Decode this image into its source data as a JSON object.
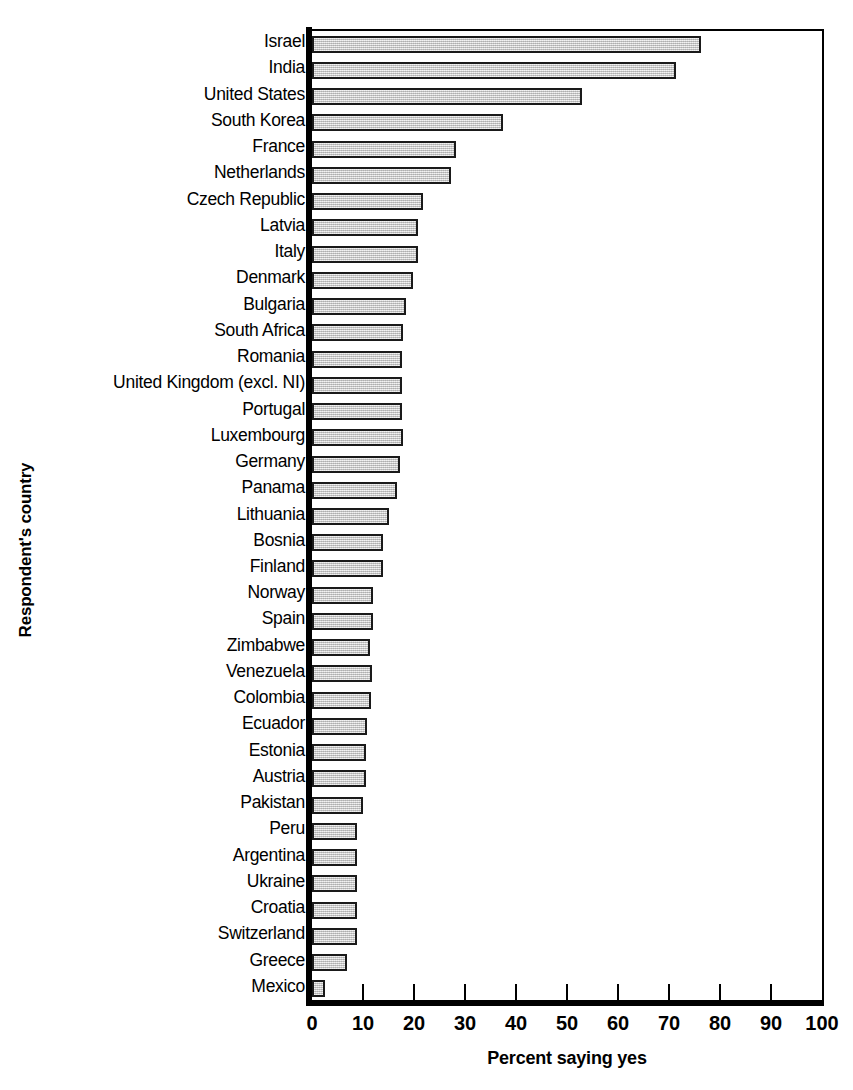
{
  "chart_data": {
    "type": "bar",
    "orientation": "horizontal",
    "title": "",
    "xlabel": "Percent saying yes",
    "ylabel": "Respondent's country",
    "xlim": [
      0,
      100
    ],
    "xticks": [
      0,
      10,
      20,
      30,
      40,
      50,
      60,
      70,
      80,
      90,
      100
    ],
    "grid": false,
    "legend": null,
    "bar_fill_color": "#d4d4d4",
    "bar_edge_color": "#1a1a1a",
    "categories": [
      "Israel",
      "India",
      "United States",
      "South Korea",
      "France",
      "Netherlands",
      "Czech Republic",
      "Latvia",
      "Italy",
      "Denmark",
      "Bulgaria",
      "South Africa",
      "Romania",
      "United Kingdom (excl. NI)",
      "Portugal",
      "Luxembourg",
      "Germany",
      "Panama",
      "Lithuania",
      "Bosnia",
      "Finland",
      "Norway",
      "Spain",
      "Zimbabwe",
      "Venezuela",
      "Colombia",
      "Ecuador",
      "Estonia",
      "Austria",
      "Pakistan",
      "Peru",
      "Argentina",
      "Ukraine",
      "Croatia",
      "Switzerland",
      "Greece",
      "Mexico"
    ],
    "values": [
      76.3,
      71.4,
      53.0,
      37.5,
      28.3,
      27.3,
      21.7,
      20.8,
      20.8,
      19.8,
      18.4,
      17.9,
      17.7,
      17.7,
      17.6,
      17.9,
      17.3,
      16.7,
      15.0,
      14.0,
      14.0,
      12.0,
      12.0,
      11.4,
      11.7,
      11.5,
      10.8,
      10.6,
      10.6,
      10.0,
      8.8,
      8.8,
      8.8,
      8.8,
      8.8,
      6.9,
      2.6
    ]
  }
}
